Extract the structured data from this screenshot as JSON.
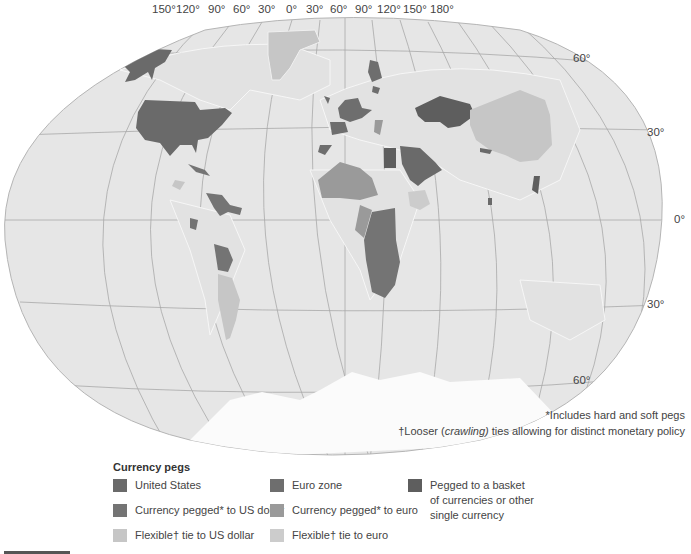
{
  "map": {
    "top_longitude_labels": [
      "150°",
      "120°",
      "90°",
      "60°",
      "30°",
      "0°",
      "30°",
      "60°",
      "90°",
      "120°",
      "150°",
      "180°"
    ],
    "right_latitude_labels": [
      "60°",
      "30°",
      "0°",
      "30°",
      "60°"
    ],
    "colors": {
      "ocean": "#e6e6e6",
      "graticule": "#a8a8a8",
      "coast": "#f4f4f4",
      "united_states": "#6a6a6a",
      "pegged_usd": "#747474",
      "flexible_usd": "#c6c6c6",
      "euro_zone": "#6e6e6e",
      "pegged_euro": "#9a9a9a",
      "flexible_euro": "#cccccc",
      "basket": "#5e5e5e",
      "antarctica": "#fbfbfb"
    }
  },
  "footnotes": {
    "hard_soft": "*Includes hard and soft pegs",
    "looser_prefix": "†Looser (",
    "looser_italic": "crawling)",
    "looser_suffix": " ties allowing for distinct monetary policy"
  },
  "legend": {
    "title": "Currency pegs",
    "items": [
      {
        "label": "United States",
        "color": "#6a6a6a"
      },
      {
        "label": "Currency pegged* to US dollar",
        "color": "#747474"
      },
      {
        "label": "Flexible† tie to US dollar",
        "color": "#c6c6c6"
      },
      {
        "label": "Euro zone",
        "color": "#6e6e6e"
      },
      {
        "label": "Currency pegged* to euro",
        "color": "#9a9a9a"
      },
      {
        "label": "Flexible† tie to euro",
        "color": "#cccccc"
      },
      {
        "label": "Pegged to a basket of currencies or other single currency",
        "line1": "Pegged to a basket",
        "line2": "of currencies or other",
        "line3": "single currency",
        "color": "#5e5e5e"
      }
    ]
  }
}
